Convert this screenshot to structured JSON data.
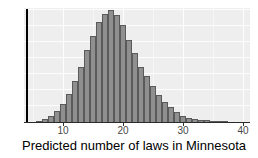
{
  "chart_data": {
    "type": "bar",
    "subtype": "histogram",
    "title": "",
    "xlabel": "Predicted number of laws in Minnesota",
    "ylabel": "",
    "y_units": "relative frequency (y axis unlabeled in figure)",
    "bin_width": 1,
    "categories": [
      6,
      7,
      8,
      9,
      10,
      11,
      12,
      13,
      14,
      15,
      16,
      17,
      18,
      19,
      20,
      21,
      22,
      23,
      24,
      25,
      26,
      27,
      28,
      29,
      30,
      31,
      32,
      33,
      34,
      35,
      36,
      37
    ],
    "values": [
      1,
      3,
      6,
      11,
      18,
      28,
      41,
      55,
      72,
      86,
      100,
      108,
      112,
      107,
      97,
      82,
      69,
      55,
      46,
      36,
      27,
      20,
      15,
      10,
      6,
      4,
      3,
      2,
      2,
      1,
      1,
      1
    ],
    "x_ticks": [
      10,
      20,
      30,
      40
    ],
    "x_minor_ticks": [
      5,
      15,
      25,
      35
    ],
    "xlim": [
      3.5,
      41.2
    ],
    "ylim": [
      0,
      114
    ],
    "grid": true,
    "legend_position": "none",
    "vline": {
      "x": 4
    },
    "colors": {
      "bar_fill": "#8f8f8f",
      "bar_border": "#5a5a5a",
      "plot_background": "#eeeeee",
      "gridline": "#ffffff",
      "axis_line": "#2b2b2b",
      "tick_label": "#474747",
      "axis_title": "#000000",
      "vline": "#000000"
    }
  }
}
